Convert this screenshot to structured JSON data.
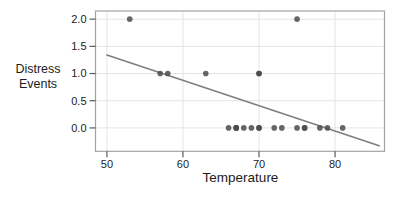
{
  "chart_data": {
    "type": "scatter",
    "title": "",
    "xlabel": "Temperature",
    "ylabel_lines": [
      "Distress",
      "Events"
    ],
    "x_ticks": [
      "50",
      "60",
      "70",
      "80"
    ],
    "x_tick_values": [
      50,
      60,
      70,
      80
    ],
    "y_ticks": [
      "0.0",
      "0.5",
      "1.0",
      "1.5",
      "2.0"
    ],
    "y_tick_values": [
      0,
      0.5,
      1,
      1.5,
      2
    ],
    "xlim": [
      48.5,
      86.5
    ],
    "ylim": [
      -0.43,
      2.15
    ],
    "grid": true,
    "legend": "none",
    "points": {
      "x": [
        53,
        57,
        58,
        63,
        66,
        67,
        67,
        67,
        68,
        69,
        70,
        70,
        70,
        70,
        72,
        73,
        75,
        75,
        76,
        76,
        78,
        79,
        81
      ],
      "y": [
        2,
        1,
        1,
        1,
        0,
        0,
        0,
        0,
        0,
        0,
        1,
        1,
        0,
        0,
        0,
        0,
        0,
        2,
        0,
        0,
        0,
        0,
        0
      ]
    },
    "trend_line": {
      "x": [
        50,
        85.8
      ],
      "y": [
        1.34,
        -0.33
      ]
    },
    "colors": {
      "point": "#4b4b4b",
      "trend": "#7e7e7e",
      "grid": "#e4e4e4",
      "border": "#a3a3a3",
      "tick": "#5a5a5a",
      "text": "#1c1c1c"
    }
  }
}
